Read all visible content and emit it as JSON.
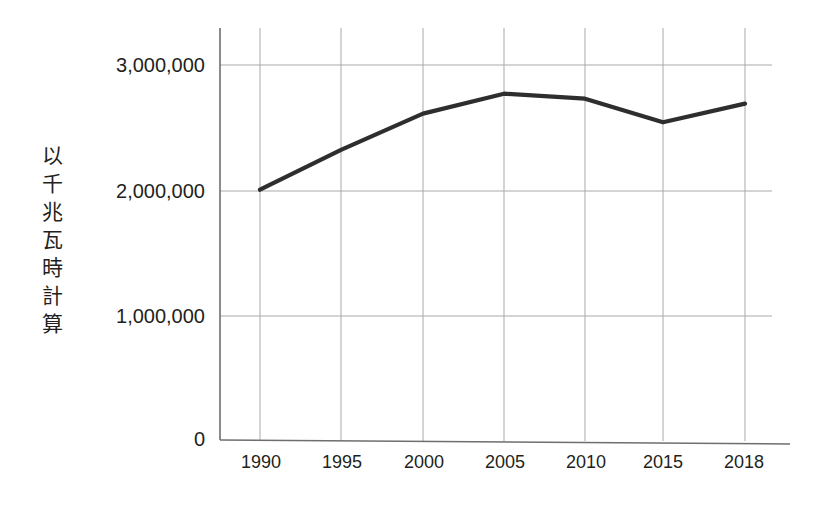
{
  "chart_data": {
    "type": "line",
    "title": "",
    "subtitle": "",
    "xlabel": "",
    "ylabel": "以千兆瓦時計算",
    "ylabel_chars": [
      "以",
      "千",
      "兆",
      "瓦",
      "時",
      "計",
      "算"
    ],
    "categories": [
      "1990",
      "1995",
      "2000",
      "2005",
      "2010",
      "2015",
      "2018"
    ],
    "x": [
      1990,
      1995,
      2000,
      2005,
      2010,
      2015,
      2018
    ],
    "values": [
      2000000,
      2320000,
      2610000,
      2770000,
      2730000,
      2540000,
      2690000
    ],
    "series": [
      {
        "name": "",
        "values": [
          2000000,
          2320000,
          2610000,
          2770000,
          2730000,
          2540000,
          2690000
        ]
      }
    ],
    "ylim": [
      0,
      3250000
    ],
    "yticks": [
      0,
      1000000,
      2000000,
      3000000
    ],
    "ytick_labels": [
      "0",
      "1,000,000",
      "2,000,000",
      "3,000,000"
    ],
    "xtick_labels": [
      "1990",
      "1995",
      "2000",
      "2005",
      "2010",
      "2015",
      "2018"
    ],
    "grid": {
      "horizontal": true,
      "vertical": true
    },
    "legend": {
      "visible": false,
      "position": "none",
      "entries": []
    },
    "annotations": [],
    "colors": {
      "line": "#2e2e2e",
      "grid": "#a9a9a9",
      "axis": "#6e6e6e",
      "text": "#231f20",
      "background": "#ffffff"
    }
  }
}
